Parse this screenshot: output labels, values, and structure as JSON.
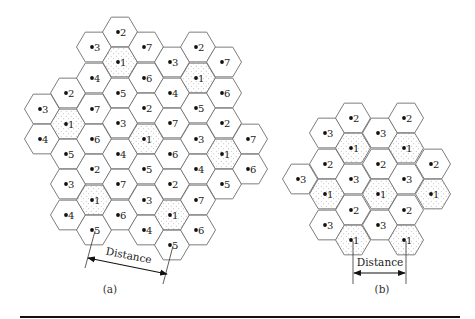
{
  "figure": {
    "colors": {
      "hex_stroke": "#6e6e6e",
      "dot": "#111111",
      "shading_dots": "#8a8a8a",
      "text": "#222222",
      "rule": "#111111"
    },
    "panels": [
      {
        "id": "a",
        "caption": "(a)",
        "caption_pos": [
          110,
          293
        ],
        "description": "7-cell frequency reuse pattern",
        "hex_radius": 17.5,
        "shaded_label": "1",
        "cells": [
          {
            "x": 42,
            "y": 109,
            "label": "3"
          },
          {
            "x": 42,
            "y": 139,
            "label": "4"
          },
          {
            "x": 68,
            "y": 93,
            "label": "2"
          },
          {
            "x": 68,
            "y": 124,
            "label": "1"
          },
          {
            "x": 68,
            "y": 154,
            "label": "5"
          },
          {
            "x": 68,
            "y": 184,
            "label": "3"
          },
          {
            "x": 68,
            "y": 215,
            "label": "4"
          },
          {
            "x": 94,
            "y": 47,
            "label": "3"
          },
          {
            "x": 94,
            "y": 78,
            "label": "4"
          },
          {
            "x": 94,
            "y": 109,
            "label": "7"
          },
          {
            "x": 94,
            "y": 139,
            "label": "6"
          },
          {
            "x": 94,
            "y": 169,
            "label": "2"
          },
          {
            "x": 94,
            "y": 200,
            "label": "1"
          },
          {
            "x": 94,
            "y": 230,
            "label": "5"
          },
          {
            "x": 120,
            "y": 32,
            "label": "2"
          },
          {
            "x": 120,
            "y": 62,
            "label": "1"
          },
          {
            "x": 120,
            "y": 93,
            "label": "5"
          },
          {
            "x": 120,
            "y": 123,
            "label": "3"
          },
          {
            "x": 120,
            "y": 154,
            "label": "4"
          },
          {
            "x": 120,
            "y": 184,
            "label": "7"
          },
          {
            "x": 120,
            "y": 215,
            "label": "6"
          },
          {
            "x": 146,
            "y": 47,
            "label": "7"
          },
          {
            "x": 146,
            "y": 78,
            "label": "6"
          },
          {
            "x": 146,
            "y": 108,
            "label": "2"
          },
          {
            "x": 146,
            "y": 139,
            "label": "1"
          },
          {
            "x": 146,
            "y": 169,
            "label": "5"
          },
          {
            "x": 146,
            "y": 200,
            "label": "3"
          },
          {
            "x": 146,
            "y": 230,
            "label": "4"
          },
          {
            "x": 172,
            "y": 62,
            "label": "3"
          },
          {
            "x": 172,
            "y": 93,
            "label": "4"
          },
          {
            "x": 172,
            "y": 123,
            "label": "7"
          },
          {
            "x": 172,
            "y": 154,
            "label": "6"
          },
          {
            "x": 172,
            "y": 184,
            "label": "2"
          },
          {
            "x": 172,
            "y": 215,
            "label": "1"
          },
          {
            "x": 172,
            "y": 245,
            "label": "5"
          },
          {
            "x": 198,
            "y": 47,
            "label": "2"
          },
          {
            "x": 198,
            "y": 78,
            "label": "1"
          },
          {
            "x": 198,
            "y": 108,
            "label": "5"
          },
          {
            "x": 198,
            "y": 139,
            "label": "3"
          },
          {
            "x": 198,
            "y": 169,
            "label": "4"
          },
          {
            "x": 198,
            "y": 200,
            "label": "7"
          },
          {
            "x": 198,
            "y": 230,
            "label": "6"
          },
          {
            "x": 224,
            "y": 62,
            "label": "7"
          },
          {
            "x": 224,
            "y": 93,
            "label": "6"
          },
          {
            "x": 224,
            "y": 123,
            "label": "2"
          },
          {
            "x": 224,
            "y": 154,
            "label": "1"
          },
          {
            "x": 224,
            "y": 184,
            "label": "5"
          },
          {
            "x": 250,
            "y": 139,
            "label": "7"
          },
          {
            "x": 250,
            "y": 169,
            "label": "6"
          }
        ],
        "distance": {
          "label": "Distance",
          "from_cell": {
            "x": 94,
            "y": 230
          },
          "to_cell": {
            "x": 172,
            "y": 245
          },
          "ext1": [
            [
              95,
              231
            ],
            [
              85,
              268
            ]
          ],
          "ext2": [
            [
              173,
              246
            ],
            [
              163,
              284
            ]
          ],
          "arrow": [
            [
              88,
              258
            ],
            [
              167,
              274
            ]
          ],
          "label_pos": [
            128,
            259
          ],
          "label_rotate": 11
        }
      },
      {
        "id": "b",
        "caption": "(b)",
        "caption_pos": [
          382,
          293
        ],
        "description": "3-cell frequency reuse pattern",
        "hex_radius": 17.5,
        "shaded_label": "1",
        "cells": [
          {
            "x": 300,
            "y": 179,
            "label": "3"
          },
          {
            "x": 327,
            "y": 133,
            "label": "3"
          },
          {
            "x": 327,
            "y": 164,
            "label": "2"
          },
          {
            "x": 327,
            "y": 194,
            "label": "1"
          },
          {
            "x": 327,
            "y": 225,
            "label": "3"
          },
          {
            "x": 353,
            "y": 118,
            "label": "2"
          },
          {
            "x": 353,
            "y": 148,
            "label": "1"
          },
          {
            "x": 353,
            "y": 179,
            "label": "3"
          },
          {
            "x": 353,
            "y": 210,
            "label": "2"
          },
          {
            "x": 353,
            "y": 240,
            "label": "1"
          },
          {
            "x": 380,
            "y": 133,
            "label": "3"
          },
          {
            "x": 380,
            "y": 164,
            "label": "2"
          },
          {
            "x": 380,
            "y": 194,
            "label": "1"
          },
          {
            "x": 380,
            "y": 225,
            "label": "3"
          },
          {
            "x": 406,
            "y": 118,
            "label": "2"
          },
          {
            "x": 406,
            "y": 148,
            "label": "1"
          },
          {
            "x": 406,
            "y": 179,
            "label": "3"
          },
          {
            "x": 406,
            "y": 210,
            "label": "2"
          },
          {
            "x": 406,
            "y": 240,
            "label": "1"
          },
          {
            "x": 433,
            "y": 164,
            "label": "2"
          },
          {
            "x": 433,
            "y": 194,
            "label": "1"
          }
        ],
        "distance": {
          "label": "Distance",
          "from_cell": {
            "x": 353,
            "y": 240
          },
          "to_cell": {
            "x": 406,
            "y": 240
          },
          "ext1": [
            [
              353,
              241
            ],
            [
              353,
              284
            ]
          ],
          "ext2": [
            [
              406,
              241
            ],
            [
              406,
              284
            ]
          ],
          "arrow": [
            [
              354,
              273
            ],
            [
              405,
              273
            ]
          ],
          "label_pos": [
            380,
            266
          ],
          "label_rotate": 0
        }
      }
    ]
  }
}
